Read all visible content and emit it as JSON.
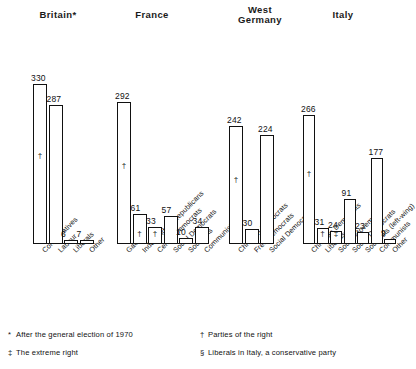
{
  "chart_data": {
    "type": "bar",
    "title": "",
    "xlabel": "",
    "ylabel": "Seats",
    "ylim": [
      0,
      340
    ],
    "grid": false,
    "legend": "none",
    "orientation": "vertical",
    "groups": [
      {
        "name": "Britain",
        "name_marks": "*",
        "categories": [
          "Conservatives",
          "Labour",
          "Liberals",
          "Other"
        ],
        "values": [
          330,
          287,
          6,
          7
        ],
        "marks": [
          "†",
          "",
          "",
          ""
        ]
      },
      {
        "name": "France",
        "name_marks": "",
        "categories": [
          "Gaullist",
          "Independent Republicans",
          "Centre Democrats",
          "Social Democrats",
          "Socialists",
          "Communists"
        ],
        "values": [
          292,
          61,
          33,
          57,
          10,
          34
        ],
        "marks": [
          "†",
          "†",
          "†",
          "",
          "",
          ""
        ]
      },
      {
        "name": "West Germany",
        "name_marks": "",
        "categories": [
          "Christian Democrats",
          "Free Democrats",
          "Social Democrats"
        ],
        "values": [
          242,
          30,
          224
        ],
        "marks": [
          "†",
          "",
          ""
        ]
      },
      {
        "name": "Italy",
        "name_marks": "",
        "categories": [
          "Christian Democrats",
          "Liberals §",
          "Social Movement",
          "Social Democrats",
          "Socialists (left-wing)",
          "Communists",
          "Other"
        ],
        "values": [
          266,
          31,
          24,
          91,
          23,
          177,
          9
        ],
        "marks": [
          "†",
          "†",
          "‡",
          "",
          "",
          "",
          ""
        ]
      }
    ]
  },
  "footnotes": [
    {
      "mark": "*",
      "text": "After the general election of 1970"
    },
    {
      "mark": "†",
      "text": "Parties of the right"
    },
    {
      "mark": "‡",
      "text": "The extreme right"
    },
    {
      "mark": "§",
      "text": "Liberals in Italy, a conservative party"
    }
  ]
}
